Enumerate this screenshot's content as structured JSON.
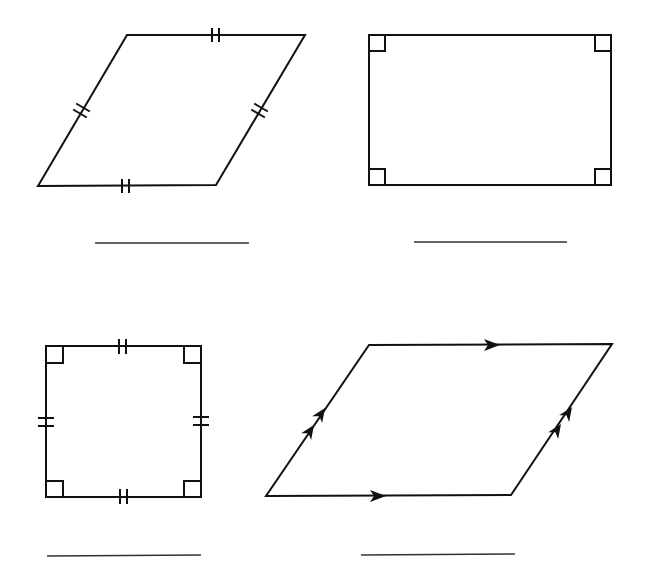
{
  "worksheet": {
    "figures": [
      {
        "id": "rhombus",
        "markings": "equal-side tick marks (double) on all four sides",
        "answer": ""
      },
      {
        "id": "rectangle",
        "markings": "right-angle marks at all four corners",
        "answer": ""
      },
      {
        "id": "square",
        "markings": "right-angle marks at all corners and double tick marks on all sides",
        "answer": ""
      },
      {
        "id": "parallelogram",
        "markings": "single arrows on top/bottom, double arrows on left/right sides",
        "answer": ""
      }
    ],
    "stroke_color": "#111111",
    "answer_line_color": "#333333"
  }
}
